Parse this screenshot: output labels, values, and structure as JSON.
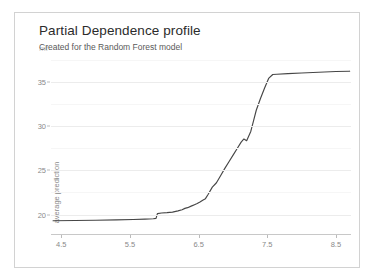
{
  "card": {
    "title": "Partial Dependence profile",
    "subtitle": "Created for the Random Forest model",
    "subtitle_artifact": "mf"
  },
  "colors": {
    "line": "#464646",
    "grid_major": "#ececec",
    "grid_minor": "#f6f6f6",
    "axis": "#c8c8c8",
    "tick_text": "#8a8a8a",
    "title_text": "#2b2b2b",
    "subtitle_text": "#5a5a5a",
    "card_border": "#d2d2d2",
    "background": "#ffffff"
  },
  "chart_data": {
    "type": "line",
    "title": "Partial Dependence profile",
    "subtitle": "Created for the Random Forest model",
    "xlabel": "",
    "ylabel": "average prediction",
    "xlim": [
      4.35,
      8.72
    ],
    "ylim": [
      17.8,
      37.6
    ],
    "xticks": [
      4.5,
      5.5,
      6.5,
      7.5,
      8.5
    ],
    "xtick_labels": [
      "4.5",
      "5.5",
      "6.5",
      "7.5",
      "8.5"
    ],
    "yticks": [
      20,
      25,
      30,
      35
    ],
    "ytick_labels": [
      "20",
      "25",
      "30",
      "35"
    ],
    "yminorticks": [
      22.5,
      27.5,
      32.5,
      37.5
    ],
    "grid": true,
    "legend": false,
    "series": [
      {
        "name": "Random Forest",
        "x": [
          4.38,
          4.7,
          5.0,
          5.3,
          5.55,
          5.72,
          5.84,
          5.88,
          5.9,
          5.96,
          6.04,
          6.12,
          6.2,
          6.26,
          6.3,
          6.34,
          6.4,
          6.44,
          6.48,
          6.52,
          6.56,
          6.6,
          6.64,
          6.7,
          6.76,
          6.82,
          6.88,
          6.94,
          7.0,
          7.06,
          7.12,
          7.16,
          7.2,
          7.26,
          7.3,
          7.34,
          7.4,
          7.46,
          7.52,
          7.58,
          7.64,
          7.8,
          8.0,
          8.25,
          8.5,
          8.7
        ],
        "y": [
          19.3,
          19.33,
          19.36,
          19.4,
          19.44,
          19.48,
          19.52,
          19.56,
          20.1,
          20.18,
          20.22,
          20.28,
          20.42,
          20.55,
          20.7,
          20.78,
          20.98,
          21.12,
          21.25,
          21.42,
          21.62,
          21.8,
          22.3,
          23.1,
          23.6,
          24.4,
          25.2,
          25.95,
          26.7,
          27.45,
          28.2,
          28.55,
          28.35,
          29.4,
          30.6,
          31.8,
          33.1,
          34.3,
          35.4,
          35.85,
          35.88,
          35.95,
          36.02,
          36.1,
          36.18,
          36.22
        ]
      }
    ]
  }
}
